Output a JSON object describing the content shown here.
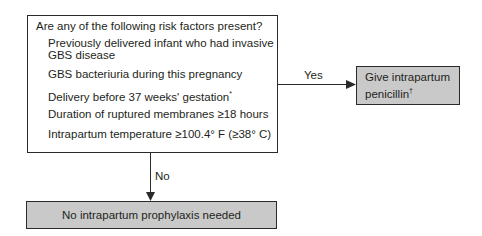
{
  "main_box": {
    "question": "Are any of the following risk factors present?",
    "factors": [
      "Previously delivered infant who had invasive",
      "GBS disease",
      "GBS bacteriuria during this pregnancy",
      "Delivery before 37 weeks' gestation",
      "Duration of ruptured membranes ≥18 hours",
      "Intrapartum temperature ≥100.4° F (≥38° C)"
    ],
    "footnote_mark": "*"
  },
  "yes_branch": {
    "label": "Yes",
    "line1": "Give intrapartum",
    "line2": "penicillin",
    "footnote_mark": "†"
  },
  "no_branch": {
    "label": "No",
    "text": "No intrapartum prophylaxis needed"
  }
}
